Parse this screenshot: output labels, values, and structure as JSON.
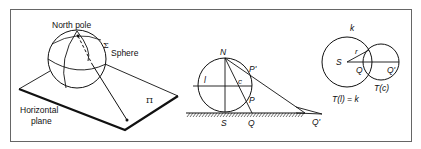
{
  "figure": {
    "panels": [
      {
        "id": "stereographic-3d",
        "labels": {
          "north_pole": "North pole",
          "sigma": "Σ",
          "sphere": "Sphere",
          "pi": "Π",
          "horizontal_line1": "Horizontal",
          "horizontal_line2": "plane"
        }
      },
      {
        "id": "cross-section",
        "labels": {
          "N": "N",
          "P_prime": "P'",
          "l": "l",
          "c": "c",
          "P": "P",
          "S": "S",
          "Q": "Q",
          "Q_prime": "Q'"
        }
      },
      {
        "id": "image-circles",
        "labels": {
          "k": "k",
          "r": "r",
          "S": "S",
          "Q": "Q",
          "Q_prime": "Q'",
          "T_l_eq_k": "T(l) = k",
          "T_c": "T(c)"
        }
      }
    ],
    "colors": {
      "stroke": "#111111",
      "frame": "#555555",
      "background": "#ffffff"
    }
  }
}
